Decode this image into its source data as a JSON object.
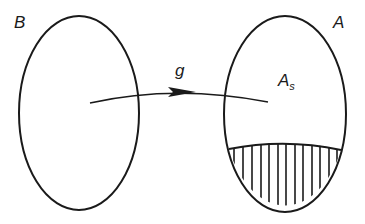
{
  "diagram": {
    "type": "set-mapping",
    "sets": [
      {
        "id": "B",
        "label": "B"
      },
      {
        "id": "A",
        "label": "A",
        "subset_label_main": "A",
        "subset_label_sub": "s"
      }
    ],
    "mapping": {
      "label": "g",
      "from": "B",
      "to": "A"
    },
    "hatched_region": {
      "description": "lower hatched region of A"
    },
    "colors": {
      "stroke": "#1a1a1a",
      "background": "#ffffff"
    }
  }
}
